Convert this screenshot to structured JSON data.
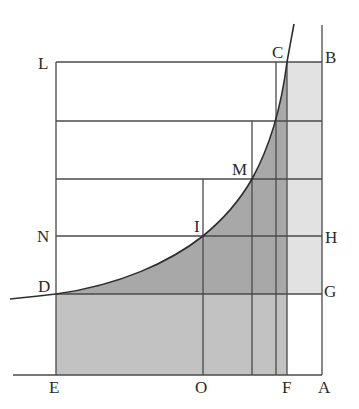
{
  "diagram": {
    "type": "geometric-figure",
    "colors": {
      "background": "#ffffff",
      "dark_fill": "#a9a9a9",
      "medium_fill": "#c4c4c4",
      "light_fill": "#e2e2e2",
      "line": "#4a4a4a"
    },
    "labels": {
      "L": "L",
      "C": "C",
      "B": "B",
      "M": "M",
      "N": "N",
      "I": "I",
      "H": "H",
      "D": "D",
      "G": "G",
      "E": "E",
      "O": "O",
      "F": "F",
      "A": "A"
    }
  }
}
